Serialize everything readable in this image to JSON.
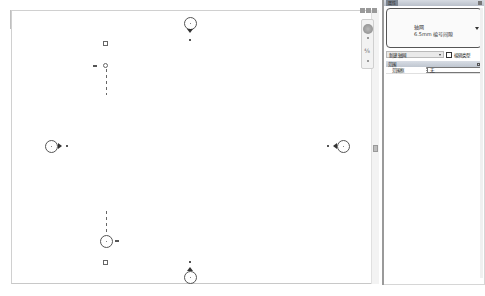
{
  "properties_panel": {
    "title": "属性",
    "type_selector": {
      "family": "轴网",
      "type": "6.5mm 编号间隙"
    },
    "instance_selector": "新建 轴网",
    "edit_type_label": "编辑类型",
    "groups": [
      {
        "name": "范围",
        "rows": [
          {
            "key": "范围框",
            "value": "无"
          }
        ]
      }
    ]
  },
  "canvas": {
    "view_controls": [
      "minimize-icon",
      "restore-icon",
      "close-icon"
    ],
    "navigation_bar": {
      "zoom_label": "⁴⁄₈"
    },
    "grid_markers": {
      "top": {
        "label": "8"
      },
      "bottom": {
        "label": "8"
      },
      "left": {
        "label": "8"
      },
      "right": {
        "label": "8"
      },
      "elev_top_label": "3D",
      "elev_bottom_label": "3D"
    }
  },
  "colors": {
    "panel_header": "#c5ccd6",
    "splitter": "#9a9a9a",
    "marker": "#333333"
  }
}
